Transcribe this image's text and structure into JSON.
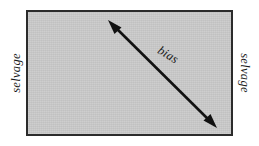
{
  "diagram": {
    "background_color": "#ffffff",
    "fabric": {
      "fill_color": "#c9c9c9",
      "border_color": "#2b2b2b",
      "border_width_px": 2,
      "x": 26,
      "y": 10,
      "width": 207,
      "height": 126
    },
    "labels": {
      "selvage_left": "selvage",
      "selvage_right": "selvage",
      "bias": "bias"
    },
    "arrow": {
      "color": "#111111",
      "stroke_width_px": 2.6,
      "double_headed": true,
      "start_x": 108,
      "start_y": 20,
      "end_x": 217,
      "end_y": 128,
      "angle_deg": 31.5
    }
  }
}
